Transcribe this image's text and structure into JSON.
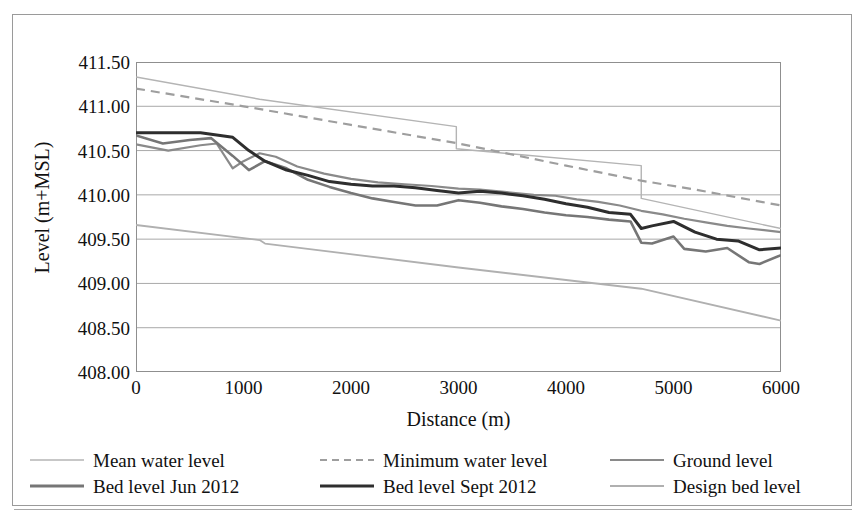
{
  "figure": {
    "background_color": "#ffffff",
    "frame_color": "#9a9a9a"
  },
  "chart_data": {
    "type": "line",
    "title": "",
    "subtitle": "",
    "xlabel": "Distance (m)",
    "ylabel": "Level (m+MSL)",
    "xlim": [
      0,
      6000
    ],
    "ylim": [
      408.0,
      411.5
    ],
    "xticks": [
      0,
      1000,
      2000,
      3000,
      4000,
      5000,
      6000
    ],
    "xtick_labels": [
      "0",
      "1000",
      "2000",
      "3000",
      "4000",
      "5000",
      "6000"
    ],
    "yticks": [
      408.0,
      408.5,
      409.0,
      409.5,
      410.0,
      410.5,
      411.0,
      411.5
    ],
    "ytick_labels": [
      "408.00",
      "408.50",
      "409.00",
      "409.50",
      "410.00",
      "410.50",
      "411.00",
      "411.50"
    ],
    "grid": "horizontal",
    "grid_color": "#a9a9a9",
    "legend_position": "bottom",
    "series": [
      {
        "name": "Mean water level",
        "color": "#b4b4b4",
        "width": 1.4,
        "dash": "solid",
        "x": [
          0,
          1150,
          2980,
          2980,
          4700,
          4700,
          6000
        ],
        "y": [
          411.33,
          411.08,
          410.77,
          410.52,
          410.33,
          409.96,
          409.62
        ]
      },
      {
        "name": "Minimum water level",
        "color": "#9e9e9e",
        "width": 2.2,
        "dash": "dashed",
        "x": [
          0,
          1000,
          2000,
          3000,
          4000,
          4700,
          5200,
          6000
        ],
        "y": [
          411.2,
          411.0,
          410.79,
          410.58,
          410.33,
          410.16,
          410.06,
          409.88
        ]
      },
      {
        "name": "Ground level",
        "color": "#8a8a8a",
        "width": 2.2,
        "dash": "solid",
        "x": [
          0,
          300,
          600,
          750,
          900,
          1000,
          1150,
          1300,
          1500,
          1750,
          2000,
          2250,
          2500,
          2750,
          3000,
          3200,
          3450,
          3700,
          3900,
          4100,
          4300,
          4500,
          4700,
          4900,
          5100,
          5300,
          5500,
          5700,
          6000
        ],
        "y": [
          410.57,
          410.5,
          410.56,
          410.58,
          410.3,
          410.38,
          410.47,
          410.43,
          410.32,
          410.24,
          410.18,
          410.14,
          410.12,
          410.1,
          410.07,
          410.06,
          410.03,
          410.0,
          409.99,
          409.95,
          409.92,
          409.88,
          409.82,
          409.78,
          409.73,
          409.69,
          409.65,
          409.62,
          409.58
        ]
      },
      {
        "name": "Bed level Jun 2012",
        "color": "#767676",
        "width": 2.6,
        "dash": "solid",
        "x": [
          0,
          250,
          500,
          700,
          900,
          1050,
          1200,
          1400,
          1600,
          1800,
          2000,
          2200,
          2400,
          2600,
          2800,
          3000,
          3200,
          3400,
          3600,
          3800,
          4000,
          4200,
          4400,
          4600,
          4700,
          4800,
          5000,
          5100,
          5300,
          5500,
          5700,
          5800,
          6000
        ],
        "y": [
          410.67,
          410.58,
          410.62,
          410.64,
          410.44,
          410.28,
          410.38,
          410.3,
          410.17,
          410.09,
          410.02,
          409.96,
          409.92,
          409.88,
          409.88,
          409.94,
          409.91,
          409.87,
          409.84,
          409.8,
          409.77,
          409.75,
          409.72,
          409.7,
          409.46,
          409.45,
          409.53,
          409.39,
          409.36,
          409.4,
          409.24,
          409.22,
          409.32
        ]
      },
      {
        "name": "Bed level Sept 2012",
        "color": "#2e2e2e",
        "width": 3.0,
        "dash": "solid",
        "x": [
          0,
          300,
          600,
          900,
          1050,
          1200,
          1400,
          1600,
          1800,
          2000,
          2200,
          2400,
          2600,
          2800,
          3000,
          3200,
          3400,
          3600,
          3800,
          4000,
          4200,
          4400,
          4600,
          4700,
          4800,
          5000,
          5200,
          5400,
          5600,
          5800,
          6000
        ],
        "y": [
          410.7,
          410.7,
          410.7,
          410.65,
          410.5,
          410.38,
          410.28,
          410.22,
          410.15,
          410.12,
          410.1,
          410.1,
          410.08,
          410.05,
          410.02,
          410.04,
          410.02,
          409.99,
          409.95,
          409.9,
          409.86,
          409.8,
          409.78,
          409.62,
          409.65,
          409.7,
          409.58,
          409.5,
          409.48,
          409.38,
          409.4
        ]
      },
      {
        "name": "Design bed level",
        "color": "#b0b0b0",
        "width": 1.8,
        "dash": "solid",
        "x": [
          0,
          1150,
          1200,
          3000,
          4700,
          6000
        ],
        "y": [
          409.66,
          409.49,
          409.45,
          409.18,
          408.94,
          408.58
        ]
      }
    ]
  },
  "legend": {
    "rows": [
      [
        {
          "label": "Mean water level",
          "color": "#b4b4b4",
          "dash": "solid",
          "width": 1.6
        },
        {
          "label": "Minimum water level",
          "color": "#9e9e9e",
          "dash": "dashed",
          "width": 2.2
        },
        {
          "label": "Ground level",
          "color": "#8a8a8a",
          "dash": "solid",
          "width": 2.2
        }
      ],
      [
        {
          "label": "Bed level Jun 2012",
          "color": "#767676",
          "dash": "solid",
          "width": 2.8
        },
        {
          "label": "Bed level Sept 2012",
          "color": "#2e2e2e",
          "dash": "solid",
          "width": 3.2
        },
        {
          "label": "Design bed level",
          "color": "#b0b0b0",
          "dash": "solid",
          "width": 2.0
        }
      ]
    ]
  }
}
